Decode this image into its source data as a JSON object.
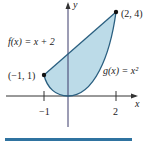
{
  "diagram": {
    "type": "region-between-curves",
    "axes": {
      "x_label": "x",
      "y_label": "y",
      "x_ticks": [
        {
          "value": -1,
          "label": "−1"
        },
        {
          "value": 2,
          "label": "2"
        }
      ]
    },
    "curves": [
      {
        "name": "f",
        "equation_label": "f(x) = x + 2",
        "kind": "line"
      },
      {
        "name": "g",
        "equation_label": "g(x) = x²",
        "kind": "parabola"
      }
    ],
    "points": [
      {
        "label": "(−1, 1)",
        "x": -1,
        "y": 1
      },
      {
        "label": "(2, 4)",
        "x": 2,
        "y": 4
      }
    ],
    "colors": {
      "region_fill": "#bcdbe8",
      "curve_stroke": "#2a5f80",
      "axis": "#333333",
      "y_axis": "#3a3a6a",
      "point": "#111111",
      "bar": "#2f73a0"
    }
  }
}
